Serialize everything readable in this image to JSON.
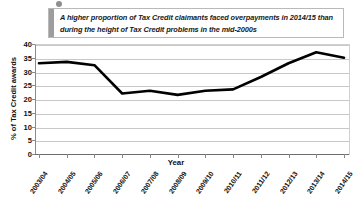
{
  "callout": {
    "text": "A higher proportion of Tax Credit claimants faced overpayments in 2014/15 than during the height of Tax Credit problems in the mid-2000s",
    "dot_color": "#8f8f8f",
    "bar_color": "#9d9d9d",
    "border_color": "#b9b9b9"
  },
  "chart_data": {
    "type": "line",
    "title": "",
    "xlabel": "Year",
    "ylabel": "% of Tax Credit awards",
    "categories": [
      "2003/04",
      "2004/05",
      "2005/06",
      "2006/07",
      "2007/08",
      "2008/09",
      "2009/10",
      "2010/11",
      "2011/12",
      "2012/13",
      "2013/14",
      "2014/15"
    ],
    "values": [
      33,
      33.5,
      32.3,
      22,
      23,
      21.5,
      23,
      23.5,
      28,
      33,
      37,
      35
    ],
    "ylim": [
      0,
      40
    ],
    "yticks": [
      0,
      5,
      10,
      15,
      20,
      25,
      30,
      35,
      40
    ],
    "grid": true,
    "legend": "none",
    "line_color": "#000000",
    "line_width": 2.6
  }
}
